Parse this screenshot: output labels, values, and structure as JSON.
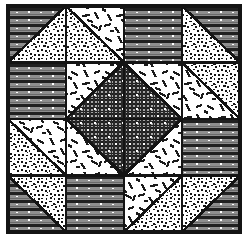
{
  "figure": {
    "name": "quilt-block-diagram",
    "title": "Pieced quilt block pattern",
    "type": "line-art-diagram",
    "width": 247,
    "height": 238
  },
  "canvas": {
    "background": "#ffffff",
    "ink": "#1a1a1a"
  },
  "block": {
    "x": 8,
    "y": 6,
    "width": 232,
    "height": 226,
    "rows": 4,
    "cols": 4,
    "border_color": "#141414",
    "border_width": 3.2,
    "grid_color": "#141414",
    "grid_width": 2.6
  },
  "fills": {
    "lines": {
      "label": "horizontal-lines",
      "base": "#8e8e8e",
      "stripe": "#202020",
      "dot": "#ffffff"
    },
    "speckle": {
      "label": "speckle-noise",
      "base": "#ffffff",
      "dot": "#141414"
    },
    "dashes": {
      "label": "white-with-dashes",
      "base": "#ffffff",
      "dash": "#1a1a1a"
    },
    "crosshatch": {
      "label": "crosshatch-dotted",
      "base": "#9a9a9a",
      "hatch": "#1e1e1e",
      "dot": "#ffffff"
    }
  },
  "cells": [
    {
      "row": 0,
      "col": 0,
      "name": "cell-r1c1",
      "split": "tlbr",
      "a": "lines",
      "b": "speckle"
    },
    {
      "row": 0,
      "col": 1,
      "name": "cell-r1c2",
      "split": "trbl",
      "a": "dashes",
      "b": "speckle"
    },
    {
      "row": 0,
      "col": 2,
      "name": "cell-r1c3",
      "split": "none",
      "a": "lines",
      "b": "lines"
    },
    {
      "row": 0,
      "col": 3,
      "name": "cell-r1c4",
      "split": "tlbr",
      "a": "lines",
      "b": "speckle"
    },
    {
      "row": 1,
      "col": 0,
      "name": "cell-r2c1",
      "split": "none",
      "a": "lines",
      "b": "lines"
    },
    {
      "row": 1,
      "col": 1,
      "name": "cell-r2c2",
      "split": "tlbr",
      "a": "dashes",
      "b": "crosshatch"
    },
    {
      "row": 1,
      "col": 2,
      "name": "cell-r2c3",
      "split": "trbl",
      "a": "dashes",
      "b": "crosshatch"
    },
    {
      "row": 1,
      "col": 3,
      "name": "cell-r2c4",
      "split": "trbl",
      "a": "speckle",
      "b": "dashes"
    },
    {
      "row": 2,
      "col": 0,
      "name": "cell-r3c1",
      "split": "trbl",
      "a": "dashes",
      "b": "speckle"
    },
    {
      "row": 2,
      "col": 1,
      "name": "cell-r3c2",
      "split": "trbl",
      "a": "crosshatch",
      "b": "dashes"
    },
    {
      "row": 2,
      "col": 2,
      "name": "cell-r3c3",
      "split": "tlbr",
      "a": "crosshatch",
      "b": "dashes"
    },
    {
      "row": 2,
      "col": 3,
      "name": "cell-r3c4",
      "split": "none",
      "a": "lines",
      "b": "lines"
    },
    {
      "row": 3,
      "col": 0,
      "name": "cell-r4c1",
      "split": "trbl",
      "a": "speckle",
      "b": "lines"
    },
    {
      "row": 3,
      "col": 1,
      "name": "cell-r4c2",
      "split": "none",
      "a": "lines",
      "b": "lines"
    },
    {
      "row": 3,
      "col": 2,
      "name": "cell-r4c3",
      "split": "tlbr",
      "a": "dashes",
      "b": "speckle"
    },
    {
      "row": 3,
      "col": 3,
      "name": "cell-r4c4",
      "split": "tlbr",
      "a": "speckle",
      "b": "lines"
    }
  ],
  "center_diamond": {
    "name": "center-diamond",
    "fill": "crosshatch",
    "points": "123,63 181,119 123,175 65,119"
  }
}
